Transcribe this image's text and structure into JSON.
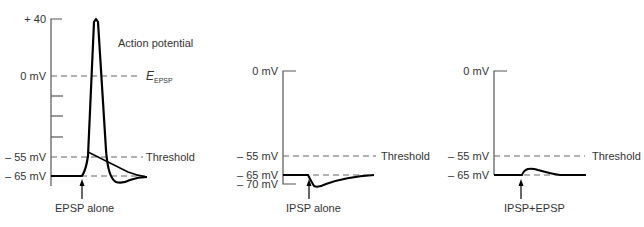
{
  "panels": [
    {
      "id": "epsp-alone",
      "caption": "EPSP alone",
      "y_labels": [
        "+ 40",
        "0 mV",
        "– 55 mV",
        "– 65 mV"
      ],
      "annotations": {
        "action_potential": "Action potential",
        "e_label": "E",
        "e_subscript": "EPSP",
        "threshold": "Threshold"
      }
    },
    {
      "id": "ipsp-alone",
      "caption": "IPSP alone",
      "y_labels": [
        "0 mV",
        "– 55 mV",
        "– 65 mV",
        "– 70 mV"
      ],
      "annotations": {
        "threshold": "Threshold"
      }
    },
    {
      "id": "ipsp-plus-epsp",
      "caption": "IPSP+EPSP",
      "y_labels": [
        "0 mV",
        "– 55 mV",
        "– 65 mV"
      ],
      "annotations": {
        "threshold": "Threshold"
      }
    }
  ],
  "colors": {
    "trace": "#000000",
    "axis": "#555555",
    "dashed": "#666666"
  }
}
